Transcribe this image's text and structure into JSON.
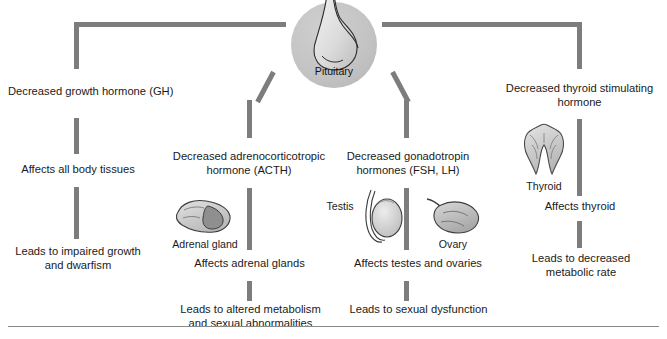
{
  "diagram": {
    "center": {
      "organ_name": "pituitary-gland",
      "label": "Pituitary"
    },
    "bottom_rule": true,
    "colors": {
      "connector": "#7d7d7d",
      "organ_fill": "#c3c3c3",
      "organ_stroke": "#4a4a4a",
      "disc_fill": "#c4c4c4",
      "text": "#1a1a1a",
      "rule": "#8a8a8a",
      "background": "#ffffff"
    },
    "branches": [
      {
        "id": "gh",
        "hormone": "Decreased growth hormone (GH)",
        "effect": "Affects all body tissues",
        "outcome": "Leads to impaired growth\nand dwarfism",
        "organ": null,
        "organ_label": null
      },
      {
        "id": "acth",
        "hormone": "Decreased adrenocorticotropic\nhormone (ACTH)",
        "effect": "Affects adrenal glands",
        "outcome": "Leads to altered metabolism\nand sexual abnormalities",
        "organ": "adrenal-gland",
        "organ_label": "Adrenal gland"
      },
      {
        "id": "gonadotropin",
        "hormone": "Decreased gonadotropin\nhormones (FSH, LH)",
        "effect": "Affects testes and ovaries",
        "outcome": "Leads to sexual dysfunction",
        "organ": "testis-and-ovary",
        "organ_label_left": "Testis",
        "organ_label_right": "Ovary"
      },
      {
        "id": "tsh",
        "hormone": "Decreased thyroid stimulating\nhormone",
        "effect": "Affects thyroid",
        "outcome": "Leads to decreased\nmetabolic rate",
        "organ": "thyroid-gland",
        "organ_label": "Thyroid"
      }
    ]
  }
}
